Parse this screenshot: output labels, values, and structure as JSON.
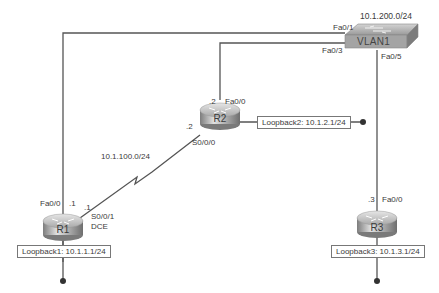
{
  "diagram": {
    "type": "network-topology",
    "switch": {
      "name": "VLAN1",
      "network": "10.1.200.0/24",
      "ports": {
        "to_r1": "Fa0/1",
        "to_r2": "Fa0/3",
        "to_r3": "Fa0/5"
      }
    },
    "routers": [
      {
        "name": "R1",
        "fa_port": "Fa0/0",
        "fa_host": ".1",
        "serial_port": "S0/0/1",
        "serial_host": ".1",
        "serial_role": "DCE",
        "loopback": "Loopback1: 10.1.1.1/24"
      },
      {
        "name": "R2",
        "fa_port": "Fa0/0",
        "fa_host": ".2",
        "serial_port": "S0/0/0",
        "serial_host": ".2",
        "loopback": "Loopback2: 10.1.2.1/24"
      },
      {
        "name": "R3",
        "fa_port": "Fa0/0",
        "fa_host": ".3",
        "loopback": "Loopback3: 10.1.3.1/24"
      }
    ],
    "serial_link": {
      "network": "10.1.100.0/24"
    },
    "colors": {
      "line": "#555555",
      "router_top": "#c8c8c8",
      "router_side": "#8a8a8a",
      "switch": "#a9a9a9"
    }
  }
}
